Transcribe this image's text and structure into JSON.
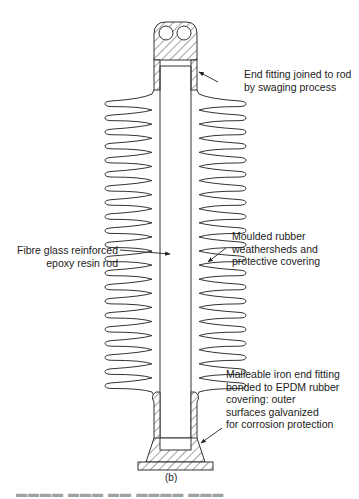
{
  "figure": {
    "subfigure_label": "(b)",
    "stroke_color": "#333333",
    "background": "#ffffff",
    "weathershed_count_per_side": 21
  },
  "labels": {
    "end_fitting_top": {
      "lines": [
        "End fitting joined to rod",
        "by swaging process"
      ]
    },
    "weathersheds": {
      "lines": [
        "Moulded rubber",
        "weathersheds and",
        "protective covering"
      ]
    },
    "rod": {
      "lines": [
        "Fibre glass reinforced",
        "epoxy resin rod"
      ]
    },
    "end_fitting_bottom": {
      "lines": [
        "Malleable iron end fitting",
        "bonded to EPDM rubber",
        "covering: outer",
        "surfaces galvanized",
        "for corrosion protection"
      ]
    }
  },
  "bottom_clipped_text": "▬▬▬▬ ▬▬▬  ▬▬ ▬▬▬▬ ▬▬▬"
}
